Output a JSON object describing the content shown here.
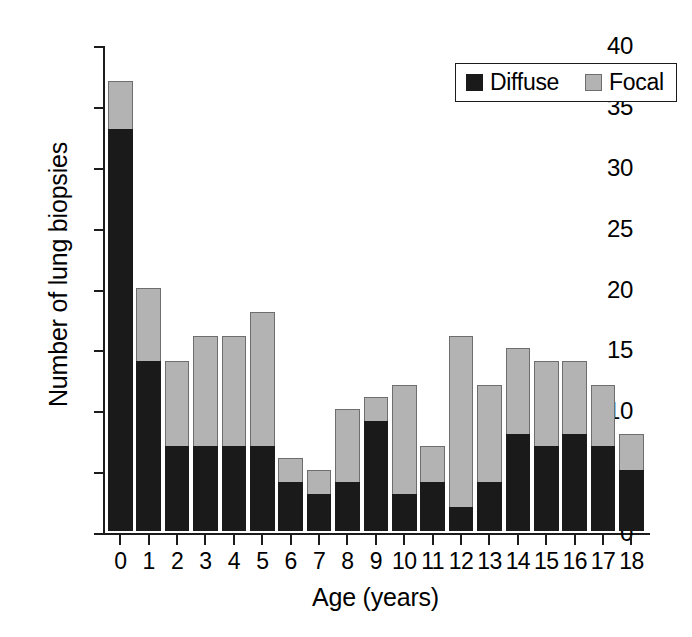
{
  "chart_data": {
    "type": "bar",
    "subtype": "stacked-vertical",
    "title": "",
    "xlabel": "Age (years)",
    "ylabel": "Number of lung biopsies",
    "categories": [
      "0",
      "1",
      "2",
      "3",
      "4",
      "5",
      "6",
      "7",
      "8",
      "9",
      "10",
      "11",
      "12",
      "13",
      "14",
      "15",
      "16",
      "17",
      "18"
    ],
    "series": [
      {
        "name": "Diffuse",
        "color": "#1a1a1a",
        "values": [
          33,
          14,
          7,
          7,
          7,
          7,
          4,
          3,
          4,
          9,
          3,
          4,
          2,
          4,
          8,
          7,
          8,
          7,
          5
        ]
      },
      {
        "name": "Focal",
        "color": "#b3b3b3",
        "values": [
          4,
          6,
          7,
          9,
          9,
          11,
          2,
          2,
          6,
          2,
          9,
          3,
          14,
          8,
          7,
          7,
          6,
          5,
          3
        ]
      }
    ],
    "totals": [
      37,
      20,
      14,
      16,
      16,
      18,
      6,
      5,
      10,
      11,
      12,
      7,
      16,
      12,
      15,
      14,
      14,
      12,
      8
    ],
    "ylim": [
      0,
      40
    ],
    "yticks": [
      0,
      5,
      10,
      15,
      20,
      25,
      30,
      35,
      40
    ],
    "grid": false,
    "legend": {
      "position": "top-right",
      "entries": [
        {
          "label": "Diffuse",
          "swatch": "diffuse"
        },
        {
          "label": "Focal",
          "swatch": "focal"
        }
      ]
    }
  },
  "axes": {
    "y_title": "Number of lung biopsies",
    "x_title": "Age (years)"
  }
}
